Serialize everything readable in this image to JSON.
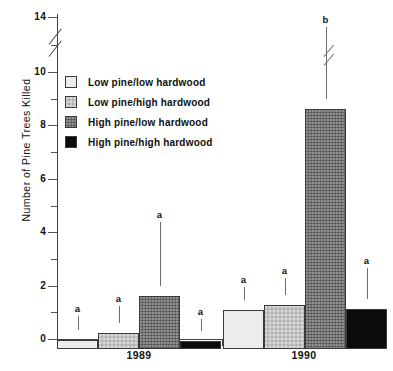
{
  "chart_data": {
    "type": "bar",
    "title": "",
    "xlabel": "",
    "ylabel": "Number of Pine Trees Killed",
    "categories": [
      "1989",
      "1990"
    ],
    "ylim": [
      0,
      14
    ],
    "yticks_major": [
      0,
      2,
      4,
      6,
      8,
      10,
      14
    ],
    "yticks_minor": [
      1,
      3,
      5,
      7,
      9,
      12
    ],
    "axis_break": {
      "present": true,
      "between": [
        10,
        14
      ]
    },
    "grid": false,
    "legend_position": "upper-left-inside",
    "series": [
      {
        "name": "Low pine/low hardwood",
        "swatch": "sw-lplh",
        "color": "#ececec",
        "values": [
          0.35,
          1.45
        ],
        "error_upper": [
          0.85,
          1.95
        ],
        "letters": [
          "a",
          "a"
        ]
      },
      {
        "name": "Low pine/high hardwood",
        "swatch": "sw-lphh",
        "color": "#c3c3c3",
        "values": [
          0.6,
          1.65
        ],
        "error_upper": [
          1.25,
          2.3
        ],
        "letters": [
          "a",
          "a"
        ]
      },
      {
        "name": "High pine/low hardwood",
        "swatch": "sw-hplh",
        "color": "#6f6f6f",
        "values": [
          2.0,
          9.0
        ],
        "error_upper": [
          4.4,
          13.3
        ],
        "letters": [
          "a",
          "b"
        ],
        "error_break": [
          false,
          true
        ]
      },
      {
        "name": "High pine/high hardwood",
        "swatch": "sw-hphh",
        "color": "#0b0b0b",
        "values": [
          0.3,
          1.5
        ],
        "error_upper": [
          0.75,
          2.65
        ],
        "letters": [
          "a",
          "a"
        ]
      }
    ]
  },
  "axis": {
    "y_label": "Number of Pine Trees Killed",
    "y_tick_labels": [
      "14",
      "10",
      "8",
      "6",
      "4",
      "2",
      "0"
    ],
    "x_tick_labels": [
      "1989",
      "1990"
    ]
  },
  "legend": {
    "items": [
      {
        "label": "Low pine/low hardwood"
      },
      {
        "label": "Low pine/high hardwood"
      },
      {
        "label": "High pine/low hardwood"
      },
      {
        "label": "High pine/high hardwood"
      }
    ]
  }
}
